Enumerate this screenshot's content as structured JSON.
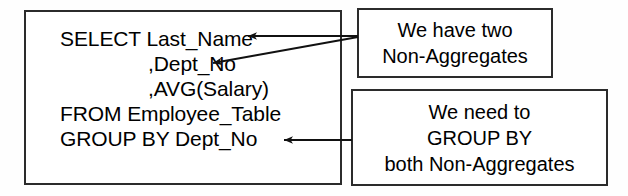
{
  "diagram": {
    "background_color": "#fefefe",
    "stroke_color": "#2b2b2b",
    "text_color": "#000000"
  },
  "sql_box": {
    "name": "sql-query",
    "lines": [
      {
        "text": "SELECT Last_Name",
        "indent": 0
      },
      {
        "text": ",Dept_No",
        "indent": 1
      },
      {
        "text": ",AVG(Salary)",
        "indent": 1
      },
      {
        "text": "FROM Employee_Table",
        "indent": 0
      },
      {
        "text": "GROUP BY Dept_No",
        "indent": 0
      }
    ]
  },
  "callouts": [
    {
      "name": "callout-non-aggregates",
      "lines": [
        "We have two",
        "Non-Aggregates"
      ]
    },
    {
      "name": "callout-group-by",
      "lines": [
        "We need to",
        "GROUP BY",
        "both Non-Aggregates"
      ]
    }
  ],
  "connectors": [
    {
      "name": "arrow-to-last-name",
      "from": "callout-non-aggregates",
      "to": "SELECT Last_Name",
      "style": "straight-arrow"
    },
    {
      "name": "arrow-to-dept-no",
      "from": "callout-non-aggregates",
      "to": ",Dept_No",
      "style": "diagonal-arrow"
    },
    {
      "name": "arrow-to-group-by",
      "from": "callout-group-by",
      "to": "GROUP BY Dept_No",
      "style": "straight-arrow"
    }
  ]
}
